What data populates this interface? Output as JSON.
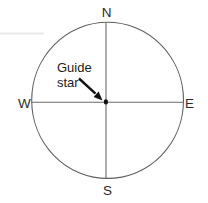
{
  "diagram": {
    "type": "compass-circle-diagram",
    "labels": {
      "north": "N",
      "south": "S",
      "east": "E",
      "west": "W"
    },
    "annotation": {
      "line1": "Guide",
      "line2": "star",
      "target": "center-dot"
    },
    "colors": {
      "background": "#ffffff",
      "circle_stroke": "#5f5f5f",
      "crosshair_stroke": "#6a6a6a",
      "text": "#2b2b2b",
      "arrow": "#111111",
      "dot": "#111111",
      "edge_artifact": "#e9e9e9"
    }
  }
}
